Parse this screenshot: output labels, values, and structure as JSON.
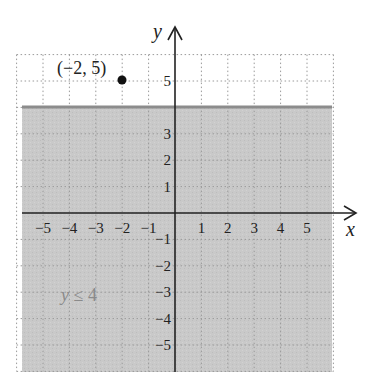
{
  "chart_data": {
    "type": "inequality-graph",
    "title": "",
    "xlabel": "x",
    "ylabel": "y",
    "xlim": [
      -6,
      6
    ],
    "ylim": [
      -6,
      6
    ],
    "grid": true,
    "grid_style": "dotted",
    "x_ticks": [
      -5,
      -4,
      -3,
      -2,
      -1,
      1,
      2,
      3,
      4,
      5
    ],
    "y_ticks": [
      -5,
      -4,
      -3,
      -2,
      -1,
      1,
      2,
      3,
      5
    ],
    "x_tick_labels": [
      "−5",
      "−4",
      "−3",
      "−2",
      "−1",
      "1",
      "2",
      "3",
      "4",
      "5"
    ],
    "y_tick_labels": [
      "−5",
      "−4",
      "−3",
      "−2",
      "−1",
      "1",
      "2",
      "3",
      "5"
    ],
    "boundary": {
      "equation": "y = 4",
      "style": "solid",
      "color": "#8c8c8c"
    },
    "shaded_region": {
      "inequality": "y ≤ 4",
      "side": "below",
      "color": "#c9c9c9"
    },
    "points": [
      {
        "x": -2,
        "y": 5,
        "label": "(−2, 5)",
        "filled": true
      }
    ],
    "annotations": [
      {
        "text": "y ≤ 4",
        "x": -3.5,
        "y": -3,
        "color": "#8a8a8a"
      }
    ]
  },
  "labels": {
    "x_axis": "x",
    "y_axis": "y",
    "point": "(−2, 5)",
    "inequality_var": "y",
    "inequality_rest": " ≤ 4"
  },
  "colors": {
    "shade": "#c9c9c9",
    "boundary": "#8c8c8c",
    "axis": "#222222",
    "grid": "#9a9a9a",
    "annotation": "#8a8a8a"
  }
}
